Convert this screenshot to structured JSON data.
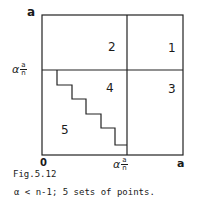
{
  "figure": {
    "axis_labels": {
      "y_top": "a",
      "y_mid_prefix": "α",
      "y_mid_num": "a",
      "y_mid_den": "n",
      "x_origin": "0",
      "x_mid_prefix": "α",
      "x_mid_num": "a",
      "x_mid_den": "n",
      "x_end": "a"
    },
    "regions": [
      "1",
      "2",
      "3",
      "4",
      "5"
    ],
    "caption_title": "Fig.5.12",
    "caption_text": "α < n-1; 5 sets of points."
  }
}
